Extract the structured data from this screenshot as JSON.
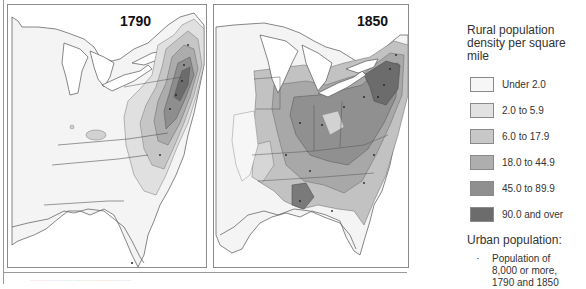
{
  "maps": [
    {
      "title": "1790",
      "panel": "left"
    },
    {
      "title": "1850",
      "panel": "right"
    }
  ],
  "legend": {
    "title": "Rural population density per square mile",
    "classes": [
      {
        "label": "Under 2.0",
        "color": "#f6f6f6"
      },
      {
        "label": "2.0 to 5.9",
        "color": "#e2e2e2"
      },
      {
        "label": "6.0 to 17.9",
        "color": "#c8c8c8"
      },
      {
        "label": "18.0 to 44.9",
        "color": "#aeaeae"
      },
      {
        "label": "45.0 to 89.9",
        "color": "#8f8f8f"
      },
      {
        "label": "90.0 and over",
        "color": "#6c6c6c"
      }
    ],
    "urban_title": "Urban population:",
    "urban_symbol": "·",
    "urban_label": "Population of 8,000 or more, 1790 and 1850"
  },
  "caption": "...................................................."
}
